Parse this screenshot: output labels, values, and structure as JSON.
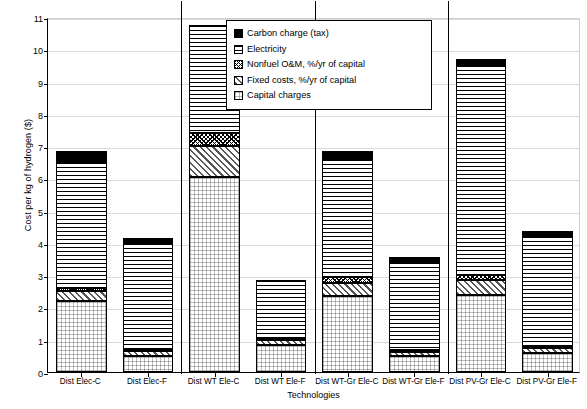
{
  "chart_data": {
    "type": "bar",
    "title": "",
    "subtitle": "",
    "xlabel": "Technologies",
    "ylabel": "Cost per kg of hydrogen ($)",
    "ylim": [
      0,
      11
    ],
    "ytick_step": 1,
    "yticks": [
      "0",
      "1",
      "2",
      "3",
      "4",
      "5",
      "6",
      "7",
      "8",
      "9",
      "10",
      "11"
    ],
    "grid": true,
    "stacked": true,
    "legend_position": "top-center-inside",
    "categories": [
      "Dist Elec-C",
      "Dist Elec-F",
      "Dist WT Ele-C",
      "Dist WT Ele-F",
      "Dist WT-Gr Ele-C",
      "Dist WT-Gr Ele-F",
      "Dist PV-Gr Ele-C",
      "Dist PV-Gr Ele-F"
    ],
    "series": [
      {
        "name": "Capital charges",
        "fill": "capital",
        "values": [
          2.2,
          0.5,
          6.05,
          0.85,
          2.35,
          0.5,
          2.4,
          0.6
        ]
      },
      {
        "name": "Fixed costs, %/yr of capital",
        "fill": "fixed",
        "values": [
          0.3,
          0.15,
          0.95,
          0.15,
          0.4,
          0.12,
          0.45,
          0.15
        ]
      },
      {
        "name": "Nonfuel O&M, %/yr of capital",
        "fill": "nonfuel",
        "values": [
          0.1,
          0.05,
          0.4,
          0.05,
          0.2,
          0.05,
          0.15,
          0.05
        ]
      },
      {
        "name": "Electricity",
        "fill": "elec",
        "values": [
          3.9,
          3.3,
          3.35,
          1.8,
          3.65,
          2.73,
          6.5,
          3.4
        ]
      },
      {
        "name": "Carbon charge (tax)",
        "fill": "carbon",
        "values": [
          0.35,
          0.15,
          0.0,
          0.0,
          0.25,
          0.15,
          0.2,
          0.15
        ]
      }
    ],
    "totals": [
      6.85,
      4.15,
      10.75,
      2.85,
      6.85,
      3.55,
      9.7,
      4.35
    ],
    "group_separators_after_category": [
      2,
      4,
      6
    ]
  },
  "legend": {
    "entries": [
      {
        "label": "Carbon charge (tax)",
        "fill": "carbon"
      },
      {
        "label": "Electricity",
        "fill": "elec"
      },
      {
        "label": "Nonfuel O&M, %/yr of capital",
        "fill": "nonfuel"
      },
      {
        "label": "Fixed costs, %/yr of capital",
        "fill": "fixed"
      },
      {
        "label": "Capital charges",
        "fill": "capital"
      }
    ]
  },
  "colors": {
    "axis": "#000000",
    "grid": "#d9d9d9",
    "background": "#ffffff",
    "carbon": "#000000"
  }
}
